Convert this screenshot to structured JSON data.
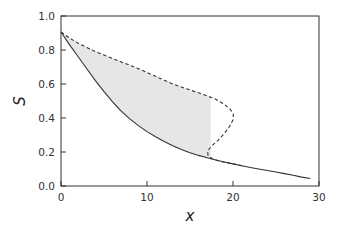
{
  "chart_data": {
    "type": "line",
    "title": "",
    "xlabel": "x",
    "ylabel": "S",
    "xlim": [
      0,
      30
    ],
    "ylim": [
      0,
      1.0
    ],
    "xticks": [
      0,
      10,
      20,
      30
    ],
    "xtick_labels": [
      "0",
      "10",
      "20",
      "30"
    ],
    "yticks": [
      0.0,
      0.2,
      0.4,
      0.6,
      0.8,
      1.0
    ],
    "ytick_labels": [
      "0.0",
      "0.2",
      "0.4",
      "0.6",
      "0.8",
      "1.0"
    ],
    "grid": false,
    "legend": null,
    "series": [
      {
        "name": "solid-curve",
        "style": "solid",
        "color": "#333333",
        "points": [
          [
            0,
            0.906
          ],
          [
            1,
            0.83
          ],
          [
            2,
            0.76
          ],
          [
            3,
            0.69
          ],
          [
            4,
            0.62
          ],
          [
            5,
            0.555
          ],
          [
            6,
            0.495
          ],
          [
            7,
            0.44
          ],
          [
            8,
            0.395
          ],
          [
            9,
            0.355
          ],
          [
            10,
            0.32
          ],
          [
            11,
            0.29
          ],
          [
            12,
            0.262
          ],
          [
            13,
            0.237
          ],
          [
            14,
            0.215
          ],
          [
            15,
            0.196
          ],
          [
            16,
            0.18
          ],
          [
            17,
            0.166
          ],
          [
            18,
            0.153
          ],
          [
            19,
            0.141
          ],
          [
            20,
            0.13
          ],
          [
            21,
            0.119
          ],
          [
            22,
            0.109
          ],
          [
            23,
            0.1
          ],
          [
            24,
            0.091
          ],
          [
            25,
            0.082
          ],
          [
            26,
            0.073
          ],
          [
            27,
            0.063
          ],
          [
            28,
            0.052
          ],
          [
            29,
            0.044
          ]
        ]
      },
      {
        "name": "dashed-curve",
        "style": "dashed",
        "color": "#333333",
        "points": [
          [
            0,
            0.906
          ],
          [
            1,
            0.87
          ],
          [
            2,
            0.84
          ],
          [
            3,
            0.815
          ],
          [
            4,
            0.79
          ],
          [
            5,
            0.77
          ],
          [
            6,
            0.75
          ],
          [
            7,
            0.73
          ],
          [
            8,
            0.71
          ],
          [
            9,
            0.69
          ],
          [
            10,
            0.668
          ],
          [
            11,
            0.645
          ],
          [
            12,
            0.622
          ],
          [
            13,
            0.6
          ],
          [
            14,
            0.582
          ],
          [
            15,
            0.565
          ],
          [
            16,
            0.548
          ],
          [
            17,
            0.53
          ],
          [
            18,
            0.51
          ],
          [
            19,
            0.48
          ],
          [
            19.7,
            0.45
          ],
          [
            20.05,
            0.42
          ],
          [
            20.0,
            0.39
          ],
          [
            19.6,
            0.35
          ],
          [
            19.0,
            0.31
          ],
          [
            18.3,
            0.27
          ],
          [
            17.5,
            0.235
          ],
          [
            17.05,
            0.205
          ],
          [
            17.1,
            0.18
          ],
          [
            17.6,
            0.16
          ],
          [
            18.5,
            0.145
          ],
          [
            19.5,
            0.135
          ],
          [
            20.5,
            0.125
          ],
          [
            21.5,
            0.115
          ]
        ]
      }
    ],
    "shaded_region": {
      "between": [
        "solid-curve",
        "dashed-curve"
      ],
      "x_range": [
        0,
        17.4
      ],
      "color": "#e6e6e6"
    }
  }
}
